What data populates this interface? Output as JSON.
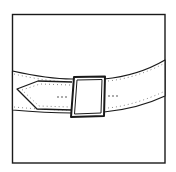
{
  "illustration": {
    "subject": "belt with rectangular buckle",
    "caption": "Line drawing of a belt fastened with a square buckle",
    "colors": {
      "background": "#ffffff",
      "ink": "#1a1a1a"
    },
    "elements": [
      "frame",
      "belt-strap",
      "belt-tip",
      "buckle",
      "stitching",
      "belt-holes"
    ]
  }
}
